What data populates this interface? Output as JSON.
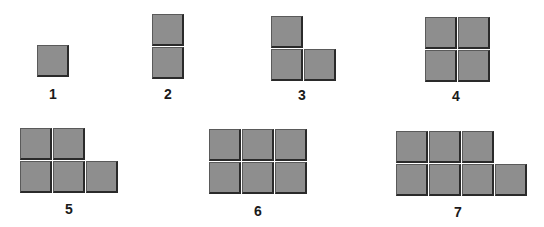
{
  "cell_color": "#8e8e8e",
  "edge_color": "#2a2a2a",
  "figures": [
    {
      "label": "1",
      "count": 1
    },
    {
      "label": "2",
      "count": 2
    },
    {
      "label": "3",
      "count": 3
    },
    {
      "label": "4",
      "count": 4
    },
    {
      "label": "5",
      "count": 5
    },
    {
      "label": "6",
      "count": 6
    },
    {
      "label": "7",
      "count": 7
    }
  ]
}
